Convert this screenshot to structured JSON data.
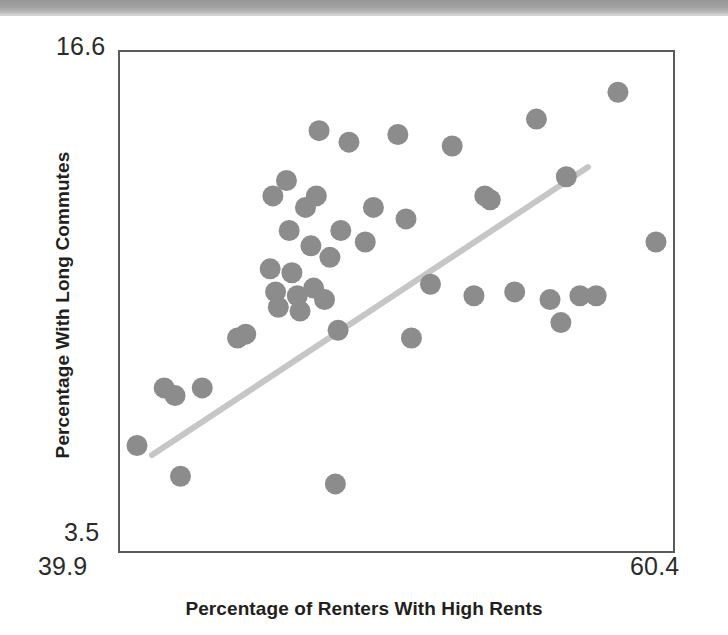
{
  "banner": {
    "label": ""
  },
  "axes": {
    "x_title": "Percentage of Renters With High Rents",
    "y_title": "Percentage With Long Commutes",
    "x_min_label": "39.9",
    "x_max_label": "60.4",
    "y_min_label": "3.5",
    "y_max_label": "16.6"
  },
  "style": {
    "point_color": "#8c8c8c",
    "trendline_color": "#c6c6c6",
    "frame_color": "#5b5b5b",
    "text_color": "#231f20",
    "background": "#ffffff",
    "point_radius": 10.5,
    "trendline_width": 6
  },
  "chart_data": {
    "type": "scatter",
    "title": "",
    "xlabel": "Percentage of Renters With High Rents",
    "ylabel": "Percentage With Long Commutes",
    "xlim": [
      39.9,
      60.4
    ],
    "ylim": [
      3.5,
      16.6
    ],
    "grid": false,
    "legend": null,
    "xticks": [
      39.9,
      60.4
    ],
    "yticks": [
      3.5,
      16.6
    ],
    "series": [
      {
        "name": "States",
        "marker": "circle",
        "color": "#8c8c8c",
        "points": [
          {
            "x": 40.6,
            "y": 6.3
          },
          {
            "x": 41.6,
            "y": 7.8
          },
          {
            "x": 42.0,
            "y": 7.6
          },
          {
            "x": 42.2,
            "y": 5.5
          },
          {
            "x": 43.0,
            "y": 7.8
          },
          {
            "x": 44.3,
            "y": 9.1
          },
          {
            "x": 44.6,
            "y": 9.2
          },
          {
            "x": 45.5,
            "y": 10.9
          },
          {
            "x": 45.6,
            "y": 12.8
          },
          {
            "x": 45.7,
            "y": 10.3
          },
          {
            "x": 45.8,
            "y": 9.9
          },
          {
            "x": 46.1,
            "y": 13.2
          },
          {
            "x": 46.2,
            "y": 11.9
          },
          {
            "x": 46.3,
            "y": 10.8
          },
          {
            "x": 46.5,
            "y": 10.2
          },
          {
            "x": 46.6,
            "y": 9.8
          },
          {
            "x": 46.8,
            "y": 12.5
          },
          {
            "x": 47.0,
            "y": 11.5
          },
          {
            "x": 47.1,
            "y": 10.4
          },
          {
            "x": 47.2,
            "y": 12.8
          },
          {
            "x": 47.3,
            "y": 14.5
          },
          {
            "x": 47.5,
            "y": 10.1
          },
          {
            "x": 47.7,
            "y": 11.2
          },
          {
            "x": 47.9,
            "y": 5.3
          },
          {
            "x": 48.0,
            "y": 9.3
          },
          {
            "x": 48.1,
            "y": 11.9
          },
          {
            "x": 48.4,
            "y": 14.2
          },
          {
            "x": 49.0,
            "y": 11.6
          },
          {
            "x": 49.3,
            "y": 12.5
          },
          {
            "x": 50.2,
            "y": 14.4
          },
          {
            "x": 50.5,
            "y": 12.2
          },
          {
            "x": 50.7,
            "y": 9.1
          },
          {
            "x": 51.4,
            "y": 10.5
          },
          {
            "x": 52.2,
            "y": 14.1
          },
          {
            "x": 53.0,
            "y": 10.2
          },
          {
            "x": 53.4,
            "y": 12.8
          },
          {
            "x": 53.6,
            "y": 12.7
          },
          {
            "x": 54.5,
            "y": 10.3
          },
          {
            "x": 55.3,
            "y": 14.8
          },
          {
            "x": 55.8,
            "y": 10.1
          },
          {
            "x": 56.2,
            "y": 9.5
          },
          {
            "x": 56.4,
            "y": 13.3
          },
          {
            "x": 56.9,
            "y": 10.2
          },
          {
            "x": 57.5,
            "y": 10.2
          },
          {
            "x": 58.3,
            "y": 15.5
          },
          {
            "x": 59.7,
            "y": 11.6
          }
        ]
      }
    ],
    "trendline": {
      "type": "linear",
      "x_start": 41.15,
      "y_start": 6.05,
      "x_end": 57.2,
      "y_end": 13.55,
      "color": "#c6c6c6"
    }
  }
}
